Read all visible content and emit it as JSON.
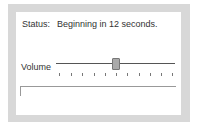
{
  "status": {
    "label": "Status:",
    "value": "Beginning in 12 seconds."
  },
  "volume": {
    "label": "Volume",
    "value_fraction": 0.5,
    "tick_count": 10
  },
  "text_field": {
    "value": ""
  }
}
